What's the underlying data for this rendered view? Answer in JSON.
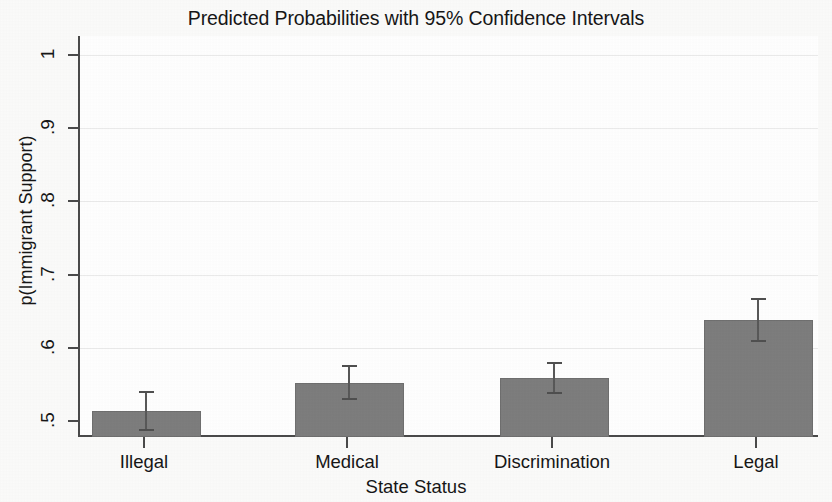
{
  "chart_data": {
    "type": "bar",
    "title": "Predicted Probabilities with 95% Confidence Intervals",
    "xlabel": "State Status",
    "ylabel": "p(Immigrant Support)",
    "categories": [
      "Illegal",
      "Medical",
      "Discrimination",
      "Legal"
    ],
    "values": [
      0.514,
      0.552,
      0.559,
      0.638
    ],
    "ci_lower": [
      0.487,
      0.528,
      0.537,
      0.608
    ],
    "ci_upper": [
      0.541,
      0.576,
      0.581,
      0.668
    ],
    "ylim": [
      0.5,
      1.0
    ],
    "ytick_labels": [
      ".5",
      ".6",
      ".7",
      ".8",
      ".9",
      "1"
    ],
    "ytick_values": [
      0.5,
      0.6,
      0.7,
      0.8,
      0.9,
      1.0
    ],
    "grid": "horizontal-faint",
    "legend": null,
    "bar_color": "#7d7d7d",
    "axis_color": "#4a4a4a",
    "grid_color": "#ebebeb",
    "background": "#ffffff"
  }
}
